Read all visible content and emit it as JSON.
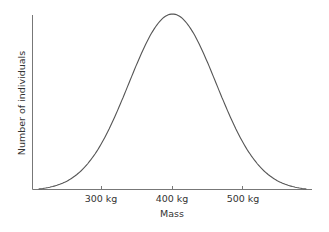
{
  "chart_data": {
    "type": "line",
    "title": "",
    "xlabel": "Mass",
    "ylabel": "Number of individuals",
    "x_ticks": [
      "300 kg",
      "400 kg",
      "500 kg"
    ],
    "x_tick_values": [
      300,
      400,
      500
    ],
    "xlim": [
      206,
      595
    ],
    "y_ticks": [],
    "grid": false,
    "legend": null,
    "series": [
      {
        "name": "Population distribution",
        "description": "Bell-shaped (normal) distribution centered at 400 kg",
        "x": [
          210,
          250,
          300,
          350,
          400,
          450,
          500,
          550,
          590
        ],
        "y": [
          0.0,
          0.13,
          0.46,
          0.86,
          1.0,
          0.86,
          0.46,
          0.13,
          0.0
        ]
      }
    ],
    "line_color": "#555555"
  }
}
